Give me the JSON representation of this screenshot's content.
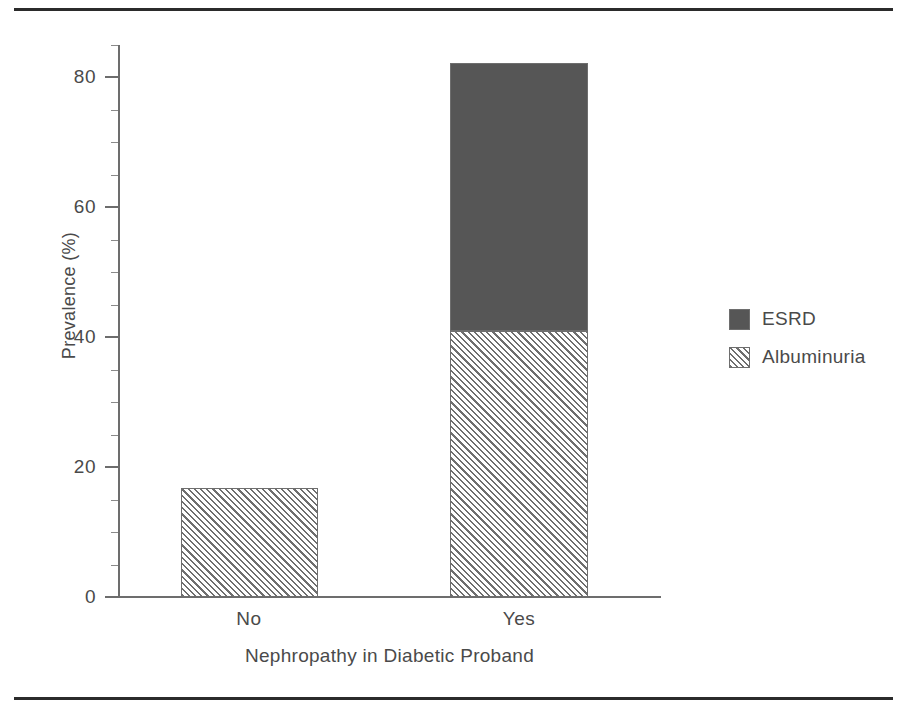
{
  "chart_data": {
    "type": "bar",
    "subtype": "stacked",
    "title": "",
    "xlabel": "Nephropathy in Diabetic Proband",
    "ylabel": "Prevalence (%)",
    "categories": [
      "No",
      "Yes"
    ],
    "series": [
      {
        "name": "Albuminuria",
        "values": [
          16.8,
          41.0
        ],
        "fill": "hatched-diagonal",
        "color": "#6f6f6f"
      },
      {
        "name": "ESRD",
        "values": [
          0,
          41.3
        ],
        "fill": "solid",
        "color": "#565656"
      }
    ],
    "stack_order_bottom_to_top": [
      "Albuminuria",
      "ESRD"
    ],
    "stack_totals": [
      16.8,
      82.3
    ],
    "ylim": [
      0,
      85
    ],
    "ymajor_ticks": [
      0,
      20,
      40,
      60,
      80
    ],
    "ytick_labels": [
      "0",
      "20",
      "40",
      "60",
      "80"
    ],
    "yminor_tick_step": 5,
    "grid": false,
    "legend_position": "right",
    "legend_entries": [
      "ESRD",
      "Albuminuria"
    ]
  },
  "axes": {
    "y_title": "Prevalence (%)",
    "x_title": "Nephropathy in Diabetic Proband",
    "y_ticks": [
      {
        "label": "80",
        "value": 80
      },
      {
        "label": "60",
        "value": 60
      },
      {
        "label": "40",
        "value": 40
      },
      {
        "label": "20",
        "value": 20
      },
      {
        "label": "0",
        "value": 0
      }
    ],
    "x_ticks": [
      {
        "label": "No"
      },
      {
        "label": "Yes"
      }
    ]
  },
  "legend": {
    "items": [
      {
        "label": "ESRD",
        "swatch": "solid-dark-gray-swatch"
      },
      {
        "label": "Albuminuria",
        "swatch": "hatched-gray-swatch"
      }
    ]
  },
  "colors": {
    "esrd_fill": "#565656",
    "albuminuria_hatch": "#6f6f6f",
    "axis": "#6d6d6d",
    "text": "#4a4a4a",
    "rule": "#2b2b2b",
    "background": "#ffffff"
  }
}
